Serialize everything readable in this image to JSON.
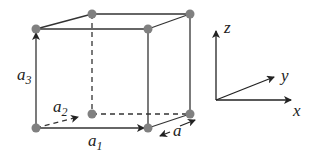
{
  "diagram": {
    "vectors": [
      {
        "id": "a1",
        "symbol": "a",
        "subscript": "1"
      },
      {
        "id": "a2",
        "symbol": "a",
        "subscript": "2"
      },
      {
        "id": "a3",
        "symbol": "a",
        "subscript": "3"
      }
    ],
    "lattice_constant_label": "a",
    "axes": {
      "x": "x",
      "y": "y",
      "z": "z"
    },
    "colors": {
      "vertex": "#808080",
      "line": "#333333"
    }
  }
}
